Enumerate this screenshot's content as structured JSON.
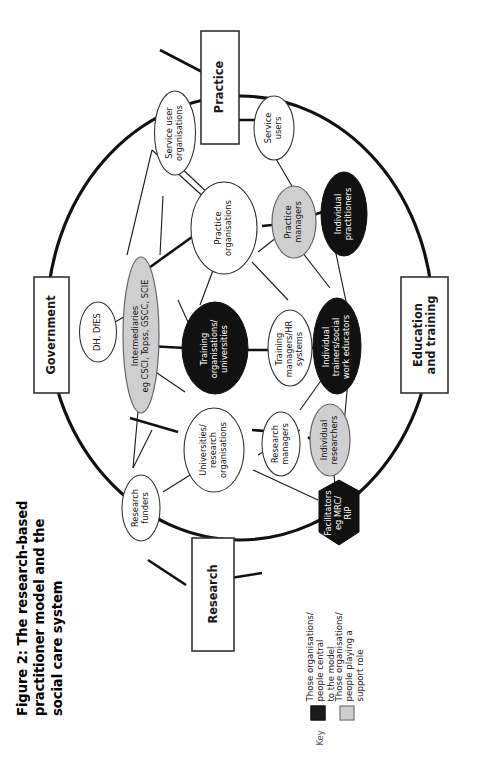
{
  "figure": {
    "title": "Figure 2: The research-based\npractitioner model and the\nsocial care system",
    "orientation": "rotated-90-ccw"
  },
  "key": {
    "label": "Key",
    "entries": [
      {
        "swatch_color": "#1b1b1b",
        "text": "Those organisations/\npeople central\nto the model"
      },
      {
        "swatch_color": "#cfcfcf",
        "text": "Those organisations/\npeople playing a\nsupport role"
      }
    ]
  },
  "domain_boxes": [
    {
      "id": "practice",
      "label": "Practice"
    },
    {
      "id": "education",
      "label": "Education\nand training"
    },
    {
      "id": "research",
      "label": "Research"
    },
    {
      "id": "government",
      "label": "Government"
    }
  ],
  "nodes": [
    {
      "id": "service-user-organisations",
      "label": "Service user\norganisations",
      "fill": "#ffffff",
      "text": "dark"
    },
    {
      "id": "service-users",
      "label": "Service\nusers",
      "fill": "#ffffff",
      "text": "dark"
    },
    {
      "id": "practice-organisations",
      "label": "Practice\norganisations",
      "fill": "#ffffff",
      "text": "dark"
    },
    {
      "id": "practice-managers",
      "label": "Practice\nmanagers",
      "fill": "#cfcfcf",
      "text": "dark"
    },
    {
      "id": "individual-practitioners",
      "label": "Individual\npractitioners",
      "fill": "#111111",
      "text": "white"
    },
    {
      "id": "dh-dfes",
      "label": "DH, DfES",
      "fill": "#ffffff",
      "text": "dark"
    },
    {
      "id": "intermediaries",
      "label": "Intermediaries\neg CSCI, Topss, GSCC, SCIE",
      "fill": "#cfcfcf",
      "text": "dark"
    },
    {
      "id": "training-organisations",
      "label": "Training\norganisations/\nuniversities",
      "fill": "#111111",
      "text": "white"
    },
    {
      "id": "training-managers-hr",
      "label": "Training\nmanagers/HR\nsystems",
      "fill": "#ffffff",
      "text": "dark"
    },
    {
      "id": "individual-trainers",
      "label": "Individual\ntrainers/social\nwork educators",
      "fill": "#111111",
      "text": "white"
    },
    {
      "id": "universities-research",
      "label": "Universities/\nresearch\norganisations",
      "fill": "#ffffff",
      "text": "dark"
    },
    {
      "id": "research-managers",
      "label": "Research\nmanagers",
      "fill": "#ffffff",
      "text": "dark"
    },
    {
      "id": "individual-researchers",
      "label": "Individual\nresearchers",
      "fill": "#cfcfcf",
      "text": "dark"
    },
    {
      "id": "research-funders",
      "label": "Research\nfunders",
      "fill": "#ffffff",
      "text": "dark"
    },
    {
      "id": "facilitators",
      "label": "Facilitators\neg MRC/\nRiP",
      "fill": "#111111",
      "text": "white"
    }
  ],
  "colors": {
    "central": "#111111",
    "support": "#cfcfcf",
    "plain": "#ffffff",
    "stroke": "#1a1a1a"
  }
}
